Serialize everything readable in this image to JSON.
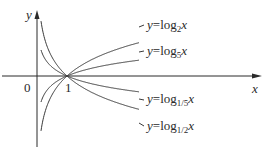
{
  "chart_data": {
    "type": "line",
    "title": "",
    "xlabel": "x",
    "ylabel": "y",
    "origin_label": "0",
    "tick_labels": {
      "x": [
        "1"
      ]
    },
    "grid": false,
    "legend": "inline labels at right ends of curves",
    "series": [
      {
        "name": "y=log_2 x",
        "label_base": "2",
        "base": 2,
        "direction": "increasing"
      },
      {
        "name": "y=log_5 x",
        "label_base": "5",
        "base": 5,
        "direction": "increasing"
      },
      {
        "name": "y=log_1/5 x",
        "label_base": "1/5",
        "base": 0.2,
        "direction": "decreasing"
      },
      {
        "name": "y=log_1/2 x",
        "label_base": "1/2",
        "base": 0.5,
        "direction": "decreasing"
      }
    ],
    "common_point": [
      1,
      0
    ],
    "annotations": [
      "All curves pass through (1, 0)",
      "y-axis is vertical asymptote"
    ]
  },
  "labels": {
    "y_axis": "y",
    "x_axis": "x",
    "origin": "0",
    "one": "1",
    "eq_prefix": "y",
    "eq_equals": "=",
    "log": "log",
    "var": "x",
    "bases": [
      "2",
      "5",
      "1/5",
      "1/2"
    ]
  },
  "colors": {
    "axis": "#2a2a2a",
    "curve": "#3a3a3a",
    "background": "#ffffff"
  }
}
